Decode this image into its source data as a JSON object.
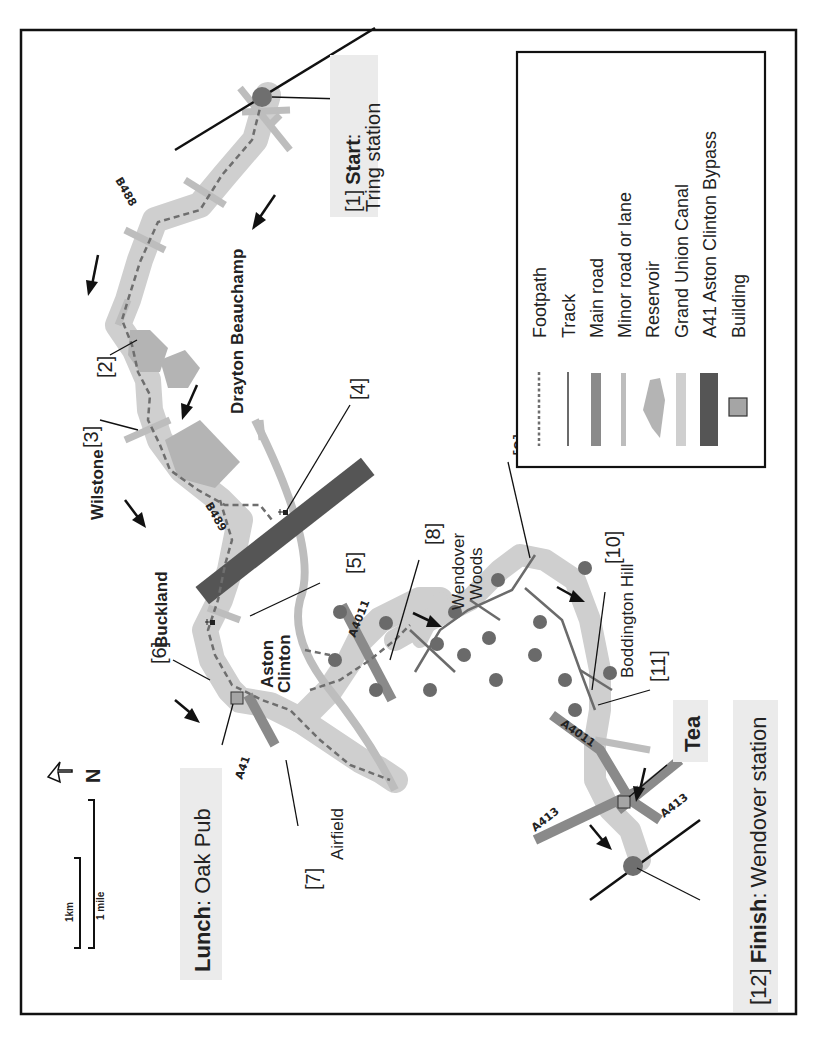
{
  "map": {
    "title_orientation": "rotated-90-ccw",
    "colors": {
      "canal": "#cfcfcf",
      "footpath": "#6e6e6e",
      "track": "#6b6b6b",
      "main_road": "#8a8a8a",
      "minor_road": "#bdbdbd",
      "reservoir": "#b0b0b0",
      "bypass": "#555555",
      "building": "#a5a5a5",
      "station": "#6f6f6f",
      "tree": "#6a6a6a",
      "label_bg": "#ebebeb"
    },
    "legend": {
      "items": [
        {
          "symbol": "footpath",
          "label": "Footpath"
        },
        {
          "symbol": "track",
          "label": "Track"
        },
        {
          "symbol": "main-road",
          "label": "Main road"
        },
        {
          "symbol": "minor-road",
          "label": "Minor road or lane"
        },
        {
          "symbol": "reservoir",
          "label": "Reservoir"
        },
        {
          "symbol": "canal",
          "label": "Grand Union Canal"
        },
        {
          "symbol": "bypass",
          "label": "A41 Aston Clinton Bypass"
        },
        {
          "symbol": "building",
          "label": "Building"
        }
      ]
    },
    "waypoints": {
      "start": {
        "num": "[1]",
        "bold": "Start",
        "sep": ":",
        "rest": "Tring station"
      },
      "p2": "[2]",
      "p3": "[3]",
      "p4": "[4]",
      "p5": "[5]",
      "p6": "[6]",
      "p7": "[7]",
      "p8": "[8]",
      "p9": "[9]",
      "p10": "[10]",
      "p11": "[11]",
      "finish": {
        "num": "[12]",
        "bold": "Finish",
        "sep": ":",
        "rest": "Wendover station"
      }
    },
    "places": {
      "drayton": "Drayton Beauchamp",
      "wilstone": "Wilstone",
      "buckland": "Buckland",
      "aston1": "Aston",
      "aston2": "Clinton",
      "wendover1": "Wendover",
      "wendover2": "Woods",
      "boddington": "Boddington Hill",
      "airfield": "Airfield",
      "tea": "Tea"
    },
    "lunch": {
      "bold": "Lunch",
      "rest": ": Oak Pub"
    },
    "roads": {
      "b488": "B488",
      "b489": "B489",
      "a41": "A41",
      "a4011_a": "A4011",
      "a4011_b": "A4011",
      "a413_a": "A413",
      "a413_b": "A413"
    },
    "scale": {
      "km": "1km",
      "mile": "1 mile"
    },
    "north": {
      "label": "N"
    }
  }
}
